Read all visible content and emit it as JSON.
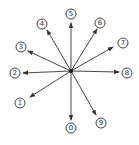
{
  "diagram": {
    "center": [
      71,
      71
    ],
    "stroke_color": "#333333",
    "arrows": [
      {
        "label": "0",
        "tip": [
          71,
          120
        ],
        "label_pos": [
          71,
          128
        ]
      },
      {
        "label": "1",
        "tip": [
          30,
          97
        ],
        "label_pos": [
          20,
          103
        ]
      },
      {
        "label": "2",
        "tip": [
          23,
          73
        ],
        "label_pos": [
          15,
          73
        ]
      },
      {
        "label": "3",
        "tip": [
          28,
          51
        ],
        "label_pos": [
          21,
          47
        ]
      },
      {
        "label": "4",
        "tip": [
          47,
          30
        ],
        "label_pos": [
          42,
          24
        ]
      },
      {
        "label": "5",
        "tip": [
          71,
          23
        ],
        "label_pos": [
          71,
          14
        ]
      },
      {
        "label": "6",
        "tip": [
          97,
          29
        ],
        "label_pos": [
          100,
          23
        ]
      },
      {
        "label": "7",
        "tip": [
          113,
          47
        ],
        "label_pos": [
          123,
          43
        ]
      },
      {
        "label": "8",
        "tip": [
          119,
          72
        ],
        "label_pos": [
          127,
          73
        ]
      },
      {
        "label": "9",
        "tip": [
          96,
          115
        ],
        "label_pos": [
          101,
          123
        ]
      }
    ]
  }
}
